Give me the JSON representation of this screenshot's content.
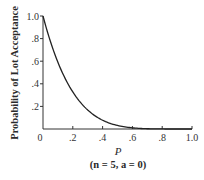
{
  "chart_data": {
    "type": "line",
    "title": "",
    "xlabel": "P",
    "xlabel_sub": "(n = 5, a = 0)",
    "ylabel": "Probability of Lot Acceptance",
    "xlim": [
      0,
      1.0
    ],
    "ylim": [
      0,
      1.0
    ],
    "x_ticks": [
      "0",
      ".2",
      ".4",
      ".6",
      ".8",
      "1.0"
    ],
    "y_ticks": [
      ".2",
      ".4",
      ".6",
      ".8",
      "1.0"
    ],
    "grid": false,
    "series": [
      {
        "name": "OC curve",
        "formula": "(1-p)^5",
        "x": [
          0,
          0.05,
          0.1,
          0.15,
          0.2,
          0.25,
          0.3,
          0.35,
          0.4,
          0.45,
          0.5,
          0.55,
          0.6,
          0.7,
          0.8,
          0.9,
          1.0
        ],
        "values": [
          1.0,
          0.774,
          0.59,
          0.444,
          0.328,
          0.237,
          0.168,
          0.116,
          0.078,
          0.05,
          0.031,
          0.018,
          0.01,
          0.002,
          0.0003,
          0.0,
          0.0
        ]
      }
    ],
    "color": "#222222"
  }
}
